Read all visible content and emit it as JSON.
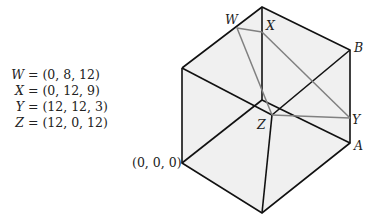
{
  "equations": [
    {
      "var": "W",
      "value": "= (0, 8, 12)"
    },
    {
      "var": "X",
      "value": "= (0, 12, 9)"
    },
    {
      "var": "Y",
      "value": "= (12, 12, 3)"
    },
    {
      "var": "Z",
      "value": "= (12, 0, 12)"
    }
  ],
  "labels": {
    "origin": "(0, 0, 0)",
    "W": "W",
    "X": "X",
    "Y": "Y",
    "Z": "Z",
    "A": "A",
    "B": "B"
  },
  "colors": {
    "cube_edge": "#111111",
    "cube_face": "#f0f0f0",
    "section_edge": "#808080"
  }
}
